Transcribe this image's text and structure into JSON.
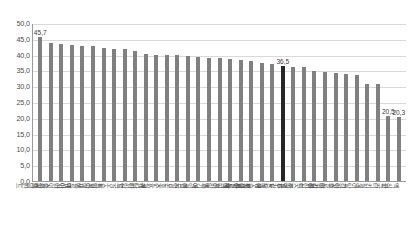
{
  "chart_data": {
    "type": "bar",
    "title": "",
    "xlabel": "",
    "ylabel": "",
    "ylim": [
      0,
      50
    ],
    "ytick_step": 5,
    "grid": true,
    "legend": null,
    "value_format": "comma-decimal",
    "highlight_category": "OECD 평균",
    "highlight_color": "#262626",
    "bar_color": "#808080",
    "categories": [
      "네덜란드",
      "스위스",
      "아이슬란드",
      "덴마크",
      "노르웨이",
      "스웨덴",
      "독일",
      "오스트리아",
      "영국",
      "핀란드",
      "캐나다",
      "뉴질랜드",
      "호주",
      "일본",
      "미국",
      "아일랜드",
      "벨기에",
      "프랑스",
      "체코",
      "슬로베니아",
      "룩셈부르크",
      "에스토니아",
      "스페인",
      "OECD 평균",
      "포르투갈",
      "이스라엘",
      "폴란드",
      "헝가리",
      "슬로바키아",
      "그리스",
      "이탈리아",
      "칠레",
      "터키",
      "한국",
      "멕시코"
    ],
    "values": [
      45.7,
      43.8,
      43.3,
      43.0,
      42.7,
      42.7,
      42.0,
      41.7,
      41.7,
      41.3,
      40.2,
      40.0,
      40.0,
      40.0,
      39.5,
      39.3,
      39.0,
      38.8,
      38.5,
      38.3,
      38.0,
      37.5,
      37.0,
      36.5,
      36.2,
      36.0,
      34.8,
      34.5,
      34.3,
      34.0,
      33.5,
      30.8,
      30.7,
      20.5,
      20.3
    ],
    "data_labels": [
      {
        "index": 0,
        "text": "45,7"
      },
      {
        "index": 23,
        "text": "36,5"
      },
      {
        "index": 33,
        "text": "20,5"
      },
      {
        "index": 34,
        "text": "20,3"
      }
    ],
    "ytick_labels": [
      "50,0",
      "45,0",
      "40,0",
      "35,0",
      "30,0",
      "25,0",
      "20,0",
      "15,0",
      "10,0",
      "5,0",
      "0,0"
    ]
  },
  "footnote": {
    "text": ""
  }
}
